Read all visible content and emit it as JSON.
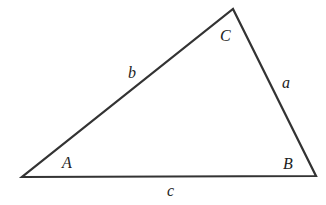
{
  "diagram": {
    "type": "triangle",
    "stroke_color": "#333333",
    "stroke_width": 2.2,
    "vertices": {
      "A": {
        "x": 22,
        "y": 177
      },
      "B": {
        "x": 316,
        "y": 176
      },
      "C": {
        "x": 233,
        "y": 9
      }
    },
    "angle_labels": {
      "A": {
        "text": "A",
        "x": 62,
        "y": 168
      },
      "B": {
        "text": "B",
        "x": 283,
        "y": 169
      },
      "C": {
        "text": "C",
        "x": 220,
        "y": 41
      }
    },
    "side_labels": {
      "a": {
        "text": "a",
        "x": 282,
        "y": 88
      },
      "b": {
        "text": "b",
        "x": 128,
        "y": 78
      },
      "c": {
        "text": "c",
        "x": 167,
        "y": 196
      }
    }
  }
}
